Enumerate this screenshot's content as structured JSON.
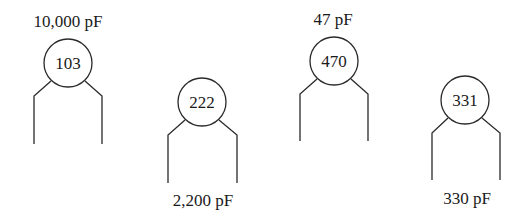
{
  "diagram": {
    "type": "ceramic-capacitor-code-illustration",
    "capacitors": [
      {
        "code": "103",
        "value_label": "10,000 pF",
        "label_position": "top",
        "cx": 68,
        "cy": 63,
        "r": 24,
        "lead_left_x": 34,
        "lead_right_x": 102,
        "bend_y": 96,
        "lead_bottom_y": 144,
        "contact_dx": 17,
        "contact_y": 81,
        "label_x": 68,
        "label_y": 27
      },
      {
        "code": "222",
        "value_label": "2,200 pF",
        "label_position": "bottom",
        "cx": 202,
        "cy": 102,
        "r": 24,
        "lead_left_x": 168,
        "lead_right_x": 237,
        "bend_y": 135,
        "lead_bottom_y": 183,
        "contact_dx": 17,
        "contact_y": 120,
        "label_x": 203,
        "label_y": 206
      },
      {
        "code": "470",
        "value_label": "47 pF",
        "label_position": "top",
        "cx": 334,
        "cy": 61,
        "r": 24,
        "lead_left_x": 300,
        "lead_right_x": 368,
        "bend_y": 94,
        "lead_bottom_y": 141,
        "contact_dx": 17,
        "contact_y": 79,
        "label_x": 333,
        "label_y": 25
      },
      {
        "code": "331",
        "value_label": "330 pF",
        "label_position": "bottom",
        "cx": 465,
        "cy": 100,
        "r": 24,
        "lead_left_x": 432,
        "lead_right_x": 500,
        "bend_y": 133,
        "lead_bottom_y": 180,
        "contact_dx": 17,
        "contact_y": 118,
        "label_x": 467,
        "label_y": 204
      }
    ]
  }
}
